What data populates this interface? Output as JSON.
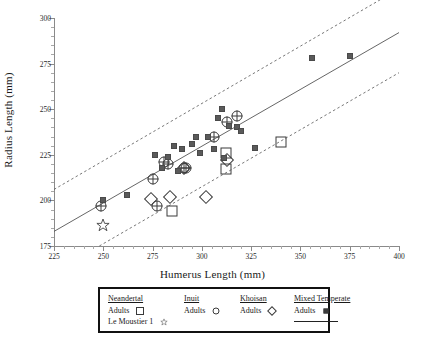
{
  "chart_data": {
    "type": "scatter",
    "title": "",
    "xlabel": "Humerus Length (mm)",
    "ylabel": "Radius Length (mm)",
    "xlim": [
      225,
      400
    ],
    "ylim": [
      175,
      300
    ],
    "xticks": [
      225,
      250,
      275,
      300,
      325,
      350,
      375,
      400
    ],
    "yticks": [
      175,
      200,
      225,
      250,
      275,
      300
    ],
    "grid": false,
    "legend_position": "below-axes",
    "series": [
      {
        "name": "Neandertal Adults",
        "marker": "open-square",
        "points": [
          [
            285,
            194
          ],
          [
            312,
            226
          ],
          [
            312,
            217
          ],
          [
            340,
            232
          ]
        ]
      },
      {
        "name": "Le Moustier 1",
        "marker": "open-star",
        "points": [
          [
            250,
            187
          ]
        ]
      },
      {
        "name": "Inuit Adults",
        "marker": "open-circle",
        "points": [
          [
            249,
            197
          ],
          [
            275,
            212
          ],
          [
            281,
            221
          ],
          [
            283,
            220
          ],
          [
            277,
            197
          ],
          [
            306,
            235
          ],
          [
            313,
            243
          ],
          [
            318,
            246
          ],
          [
            291,
            218
          ],
          [
            292,
            218
          ]
        ]
      },
      {
        "name": "Khoisan Adults",
        "marker": "open-diamond",
        "points": [
          [
            274,
            201
          ],
          [
            284,
            202
          ],
          [
            302,
            202
          ],
          [
            291,
            218
          ],
          [
            313,
            222
          ]
        ]
      },
      {
        "name": "Mixed Temperate Adults",
        "marker": "small-dot",
        "points": [
          [
            250,
            200
          ],
          [
            262,
            203
          ],
          [
            276,
            225
          ],
          [
            280,
            218
          ],
          [
            283,
            224
          ],
          [
            286,
            230
          ],
          [
            288,
            216
          ],
          [
            290,
            228
          ],
          [
            295,
            231
          ],
          [
            297,
            235
          ],
          [
            299,
            226
          ],
          [
            303,
            235
          ],
          [
            306,
            228
          ],
          [
            308,
            245
          ],
          [
            310,
            250
          ],
          [
            311,
            223
          ],
          [
            314,
            241
          ],
          [
            318,
            240
          ],
          [
            320,
            238
          ],
          [
            327,
            229
          ],
          [
            356,
            278
          ],
          [
            375,
            279
          ]
        ]
      }
    ],
    "fit_lines": [
      {
        "name": "regression",
        "style": "solid",
        "x": [
          225,
          400
        ],
        "y": [
          183,
          292
        ]
      },
      {
        "name": "upper-prediction-band",
        "style": "dashed",
        "x": [
          225,
          400
        ],
        "y": [
          206,
          316
        ]
      },
      {
        "name": "lower-prediction-band",
        "style": "dashed",
        "x": [
          248,
          400
        ],
        "y": [
          175,
          270
        ]
      }
    ]
  },
  "axes": {
    "xlabel": "Humerus Length (mm)",
    "ylabel": "Radius Length (mm)",
    "xticks": [
      "225",
      "250",
      "275",
      "300",
      "325",
      "350",
      "375",
      "400"
    ],
    "yticks": [
      "175",
      "200",
      "225",
      "250",
      "275",
      "300"
    ]
  },
  "legend": {
    "columns": [
      {
        "header": "Neandertal",
        "entries": [
          {
            "label": "Adults",
            "symbol": "open-square"
          },
          {
            "label": "Le Moustier 1",
            "symbol": "open-star"
          }
        ]
      },
      {
        "header": "Inuit",
        "entries": [
          {
            "label": "Adults",
            "symbol": "open-circle"
          }
        ]
      },
      {
        "header": "Khoisan",
        "entries": [
          {
            "label": "Adults",
            "symbol": "open-diamond"
          }
        ]
      },
      {
        "header": "Mixed Temperate",
        "entries": [
          {
            "label": "Adults",
            "symbol": "small-dot"
          },
          {
            "label": "",
            "symbol": "solid-line"
          }
        ]
      }
    ]
  },
  "colors": {
    "marker": "#3a3a3a",
    "axis": "#8a8a8a",
    "line": "#555555",
    "legend_border": "#111111",
    "background": "#ffffff"
  }
}
